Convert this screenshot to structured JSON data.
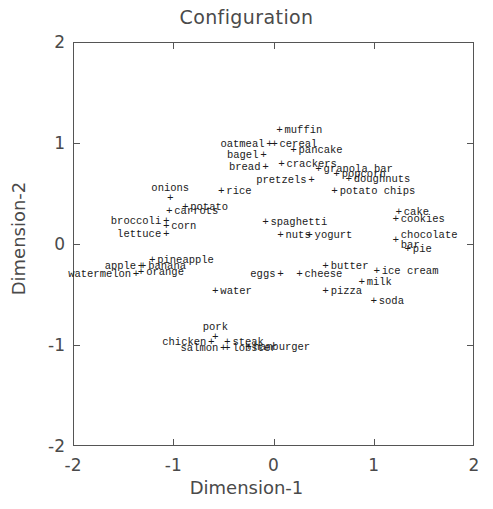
{
  "chart_data": {
    "type": "scatter",
    "title": "Configuration",
    "xlabel": "Dimension-1",
    "ylabel": "Dimension-2",
    "xlim": [
      -2,
      2
    ],
    "ylim": [
      -2,
      2
    ],
    "xticks": [
      -2,
      -1,
      0,
      1,
      2
    ],
    "yticks": [
      -2,
      -1,
      0,
      1,
      2
    ],
    "xticklabels": [
      "-2",
      "-1",
      "0",
      "1",
      "2"
    ],
    "yticklabels": [
      "-2",
      "-1",
      "0",
      "1",
      "2"
    ],
    "grid": false,
    "legend": null,
    "marker": "+",
    "points": [
      {
        "label": "muffin",
        "x": 0.06,
        "y": 1.13,
        "anchor": "right"
      },
      {
        "label": "cereal",
        "x": 0.01,
        "y": 0.99,
        "anchor": "right"
      },
      {
        "label": "oatmeal",
        "x": -0.04,
        "y": 0.99,
        "anchor": "left"
      },
      {
        "label": "pancake",
        "x": 0.2,
        "y": 0.93,
        "anchor": "right"
      },
      {
        "label": "bagel",
        "x": -0.1,
        "y": 0.88,
        "anchor": "left"
      },
      {
        "label": "bread",
        "x": -0.08,
        "y": 0.76,
        "anchor": "left"
      },
      {
        "label": "crackers",
        "x": 0.08,
        "y": 0.79,
        "anchor": "right"
      },
      {
        "label": "granola bar",
        "x": 0.45,
        "y": 0.74,
        "anchor": "right"
      },
      {
        "label": "popcorn",
        "x": 0.63,
        "y": 0.69,
        "anchor": "right"
      },
      {
        "label": "doughnuts",
        "x": 0.75,
        "y": 0.64,
        "anchor": "right"
      },
      {
        "label": "pretzels",
        "x": 0.38,
        "y": 0.63,
        "anchor": "left"
      },
      {
        "label": "rice",
        "x": -0.52,
        "y": 0.52,
        "anchor": "right"
      },
      {
        "label": "potato chips",
        "x": 0.61,
        "y": 0.52,
        "anchor": "right"
      },
      {
        "label": "onions",
        "x": -1.03,
        "y": 0.46,
        "anchor": "above"
      },
      {
        "label": "potato",
        "x": -0.88,
        "y": 0.37,
        "anchor": "right"
      },
      {
        "label": "carrots",
        "x": -1.04,
        "y": 0.33,
        "anchor": "right"
      },
      {
        "label": "cake",
        "x": 1.25,
        "y": 0.32,
        "anchor": "right"
      },
      {
        "label": "cookies",
        "x": 1.22,
        "y": 0.25,
        "anchor": "right"
      },
      {
        "label": "broccoli",
        "x": -1.07,
        "y": 0.23,
        "anchor": "left"
      },
      {
        "label": "corn",
        "x": -1.07,
        "y": 0.18,
        "anchor": "right"
      },
      {
        "label": "spaghetti",
        "x": -0.08,
        "y": 0.22,
        "anchor": "right"
      },
      {
        "label": "lettuce",
        "x": -1.07,
        "y": 0.1,
        "anchor": "left"
      },
      {
        "label": "nuts",
        "x": 0.07,
        "y": 0.09,
        "anchor": "right"
      },
      {
        "label": "yogurt",
        "x": 0.36,
        "y": 0.09,
        "anchor": "right"
      },
      {
        "label": "chocolate\nbar",
        "x": 1.22,
        "y": 0.04,
        "anchor": "right"
      },
      {
        "label": "pie",
        "x": 1.34,
        "y": -0.05,
        "anchor": "right"
      },
      {
        "label": "pineapple",
        "x": -1.21,
        "y": -0.16,
        "anchor": "right"
      },
      {
        "label": "banana",
        "x": -1.3,
        "y": -0.22,
        "anchor": "right"
      },
      {
        "label": "apple",
        "x": -1.32,
        "y": -0.22,
        "anchor": "left"
      },
      {
        "label": "orange",
        "x": -1.32,
        "y": -0.28,
        "anchor": "right"
      },
      {
        "label": "butter",
        "x": 0.52,
        "y": -0.22,
        "anchor": "right"
      },
      {
        "label": "ice cream",
        "x": 1.03,
        "y": -0.27,
        "anchor": "right"
      },
      {
        "label": "watermelon",
        "x": -1.37,
        "y": -0.3,
        "anchor": "left"
      },
      {
        "label": "eggs",
        "x": 0.07,
        "y": -0.3,
        "anchor": "left"
      },
      {
        "label": "cheese",
        "x": 0.26,
        "y": -0.3,
        "anchor": "right"
      },
      {
        "label": "milk",
        "x": 0.88,
        "y": -0.38,
        "anchor": "right"
      },
      {
        "label": "water",
        "x": -0.58,
        "y": -0.47,
        "anchor": "right"
      },
      {
        "label": "pizza",
        "x": 0.52,
        "y": -0.47,
        "anchor": "right"
      },
      {
        "label": "soda",
        "x": 1.0,
        "y": -0.56,
        "anchor": "right"
      },
      {
        "label": "pork",
        "x": -0.58,
        "y": -0.92,
        "anchor": "above"
      },
      {
        "label": "chicken",
        "x": -0.62,
        "y": -0.97,
        "anchor": "left"
      },
      {
        "label": "steak",
        "x": -0.46,
        "y": -0.97,
        "anchor": "right"
      },
      {
        "label": "hamburger",
        "x": -0.25,
        "y": -1.02,
        "anchor": "right"
      },
      {
        "label": "lobster",
        "x": -0.46,
        "y": -1.03,
        "anchor": "right"
      },
      {
        "label": "salmon",
        "x": -0.5,
        "y": -1.03,
        "anchor": "left"
      }
    ]
  }
}
